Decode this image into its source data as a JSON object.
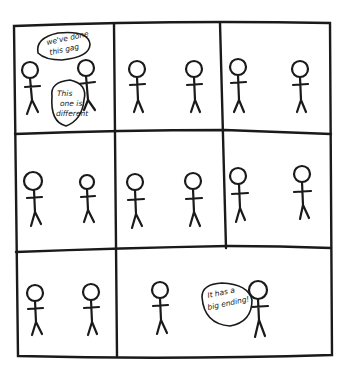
{
  "comic": {
    "layout": "3x3 panel grid, final row has 2 panels (small + wide)",
    "panels": [
      {
        "id": 1,
        "figures": 2,
        "dialogue": [
          {
            "speaker": "left",
            "line1": "we've done",
            "line2": "this gag"
          },
          {
            "speaker": "right",
            "line1": "This",
            "line2": "one is",
            "line3": "different"
          }
        ]
      },
      {
        "id": 2,
        "figures": 2,
        "dialogue": []
      },
      {
        "id": 3,
        "figures": 2,
        "dialogue": []
      },
      {
        "id": 4,
        "figures": 2,
        "dialogue": []
      },
      {
        "id": 5,
        "figures": 2,
        "dialogue": []
      },
      {
        "id": 6,
        "figures": 2,
        "dialogue": []
      },
      {
        "id": 7,
        "figures": 2,
        "dialogue": []
      },
      {
        "id": 8,
        "figures": 2,
        "dialogue": [
          {
            "speaker": "right",
            "line1": "It has a",
            "line2": "big ending!"
          }
        ]
      }
    ],
    "colors": {
      "ink": "#1a1a1a",
      "paper": "#ffffff"
    }
  }
}
